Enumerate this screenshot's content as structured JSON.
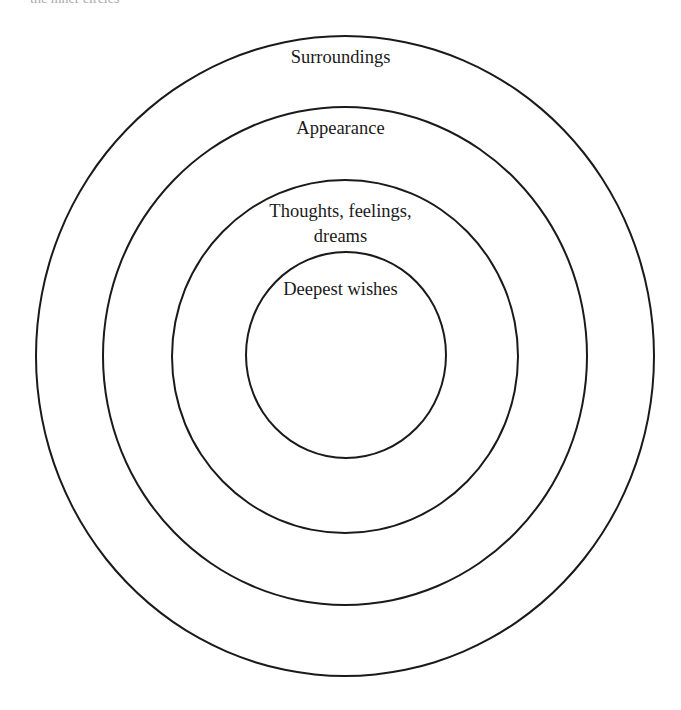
{
  "diagram": {
    "type": "concentric-circles",
    "clipped_header_text": "the inner circles",
    "rings": [
      {
        "id": "surroundings",
        "label": "Surroundings",
        "level": 1
      },
      {
        "id": "appearance",
        "label": "Appearance",
        "level": 2
      },
      {
        "id": "thoughts",
        "label_line1": "Thoughts, feelings,",
        "label_line2": "dreams",
        "level": 3
      },
      {
        "id": "deepest",
        "label": "Deepest wishes",
        "level": 4
      }
    ]
  }
}
